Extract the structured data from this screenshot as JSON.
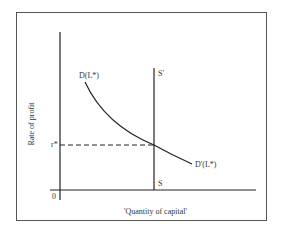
{
  "diagram": {
    "title": "",
    "y_axis_label": "Rate of  profit",
    "x_axis_label": "'Quantity of capital'",
    "origin_label": "0",
    "equilibrium_rate_label": "r*",
    "demand_curve_top_label": "D(L*)",
    "demand_curve_bottom_label": "D'(L*)",
    "supply_top_label": "S'",
    "supply_bottom_label": "S",
    "colors": {
      "line": "#222222",
      "text": "#333333",
      "frame": "#555555"
    }
  }
}
